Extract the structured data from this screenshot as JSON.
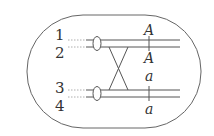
{
  "diagram": {
    "type": "cell with homologous chromosomes showing crossing over",
    "chromatid_labels": [
      "1",
      "2",
      "3",
      "4"
    ],
    "gene_labels": {
      "chromatid_1": "A",
      "chromatid_2": "A",
      "chromatid_3": "a",
      "chromatid_4": "a"
    },
    "colors": {
      "stroke": "#555555",
      "text": "#333333"
    }
  }
}
